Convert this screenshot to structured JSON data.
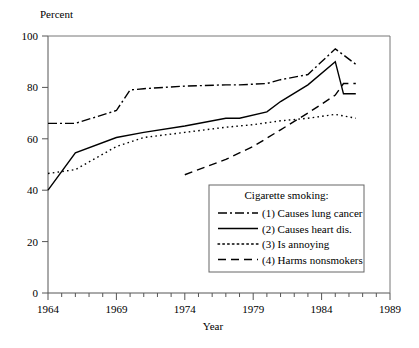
{
  "chart_data": {
    "type": "line",
    "title": "",
    "xlabel": "Year",
    "ylabel": "Percent",
    "xlim": [
      1964,
      1989
    ],
    "ylim": [
      0,
      100
    ],
    "grid": false,
    "legend_position": "inside-bottom-right",
    "legend_title": "Cigarette smoking:",
    "x_ticks": [
      1964,
      1969,
      1974,
      1979,
      1984,
      1989
    ],
    "x_minor_tick_step": 1,
    "y_ticks": [
      0,
      20,
      40,
      60,
      80,
      100
    ],
    "series": [
      {
        "name": "(1) Causes lung cancer",
        "key": "causes-lung-cancer",
        "dash": "dashdot",
        "dash_pattern": "9,3,2,3",
        "x": [
          1964,
          1966,
          1969,
          1970,
          1971,
          1974,
          1977,
          1978,
          1980,
          1981,
          1983,
          1985,
          1986.5
        ],
        "y": [
          66,
          66,
          71,
          79,
          79.5,
          80.5,
          81,
          81,
          81.5,
          83,
          85,
          95,
          89
        ]
      },
      {
        "name": "(2) Causes heart dis.",
        "key": "causes-heart-dis",
        "dash": "solid",
        "dash_pattern": "none",
        "x": [
          1964,
          1966,
          1969,
          1971,
          1974,
          1977,
          1978,
          1980,
          1981,
          1983,
          1985,
          1985.6,
          1986.5
        ],
        "y": [
          40,
          54.5,
          60.5,
          62.5,
          65,
          68,
          68,
          70.5,
          74.5,
          81,
          90,
          77.5,
          77.5
        ]
      },
      {
        "name": "(3) Is annoying",
        "key": "is-annoying",
        "dash": "dotted",
        "dash_pattern": "1.6,3.2",
        "x": [
          1964,
          1966,
          1969,
          1971,
          1974,
          1977,
          1979,
          1981,
          1983,
          1985,
          1986.5
        ],
        "y": [
          46.5,
          48,
          57,
          60.5,
          62.5,
          64.5,
          65.5,
          67,
          68,
          69.5,
          68
        ]
      },
      {
        "name": "(4) Harms nonsmokers",
        "key": "harms-nonsmokers",
        "dash": "dashed",
        "dash_pattern": "8,5",
        "x": [
          1974,
          1977,
          1979,
          1981,
          1983,
          1985,
          1985.6,
          1986.5
        ],
        "y": [
          46,
          52,
          57,
          63.5,
          70,
          77,
          81.5,
          81.5
        ]
      }
    ]
  },
  "plot": {
    "left": 48,
    "right": 390,
    "top": 36,
    "bottom": 293
  },
  "labels": {
    "y_axis_title": "Percent",
    "x_axis_title": "Year"
  }
}
